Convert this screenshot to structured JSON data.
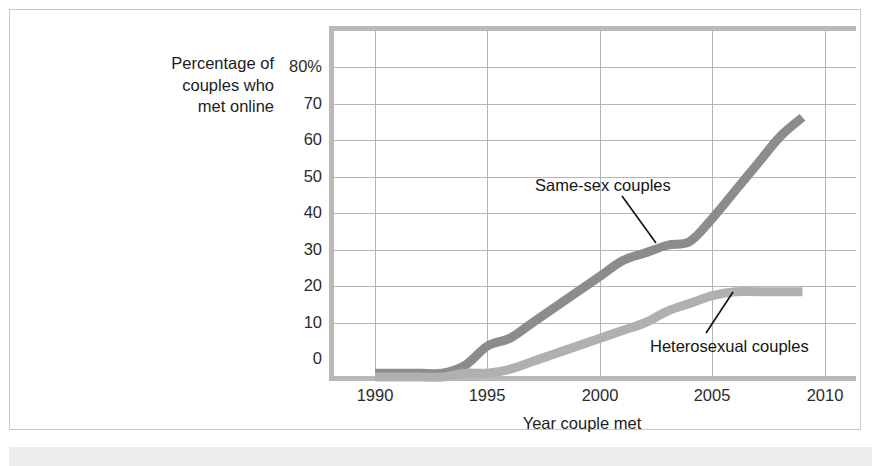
{
  "figure": {
    "background_color": "#ffffff",
    "frame_color": "#c9c9c9",
    "bottom_band_color": "#ececec"
  },
  "chart_data": {
    "type": "line",
    "title": "",
    "subtitle": "",
    "xlabel": "Year couple met",
    "ylabel": "Percentage of couples who met online",
    "ylabel_lines": [
      "Percentage of",
      "couples who",
      "met online"
    ],
    "xlim": [
      1989,
      2011
    ],
    "ylim": [
      0,
      84
    ],
    "xticks": [
      1990,
      1995,
      2000,
      2005,
      2010
    ],
    "xtick_labels": [
      "1990",
      "1995",
      "2000",
      "2005",
      "2010"
    ],
    "yticks": [
      0,
      10,
      20,
      30,
      40,
      50,
      60,
      70,
      80
    ],
    "ytick_labels": [
      "0",
      "10",
      "20",
      "30",
      "40",
      "50",
      "60",
      "70",
      "80%"
    ],
    "grid": true,
    "legend_position": "inline-annotations",
    "x": [
      1990,
      1991,
      1992,
      1993,
      1994,
      1995,
      1996,
      1997,
      1998,
      1999,
      2000,
      2001,
      2002,
      2003,
      2004,
      2005,
      2006,
      2007,
      2008,
      2009
    ],
    "series": [
      {
        "name": "Same-sex couples",
        "color": "#8c8c8c",
        "values": [
          1,
          1,
          1,
          1,
          3,
          8,
          10,
          14,
          18,
          22,
          26,
          30,
          32,
          34,
          35,
          41,
          48,
          55,
          62,
          67
        ]
      },
      {
        "name": "Heterosexual couples",
        "color": "#b0b0b0",
        "values": [
          0,
          0,
          0,
          0,
          1,
          1,
          2,
          4,
          6,
          8,
          10,
          12,
          14,
          17,
          19,
          21,
          22,
          22,
          22,
          22
        ]
      }
    ],
    "annotations": [
      {
        "text": "Same-sex couples",
        "target_x": 2002,
        "target_y": 33
      },
      {
        "text": "Heterosexual couples",
        "target_x": 2006.5,
        "target_y": 22
      }
    ]
  }
}
